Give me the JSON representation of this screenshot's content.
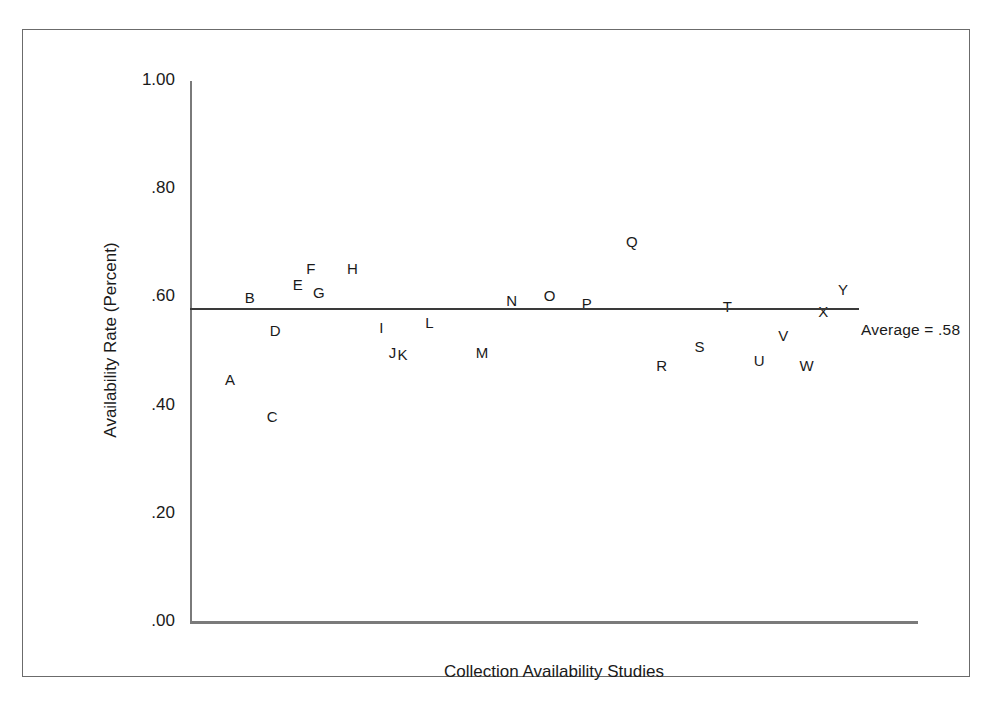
{
  "figure": {
    "background_color": "#ffffff",
    "frame_color": "#6b6b6b",
    "axis_color": "#7a7a7a",
    "text_color": "#1a1a1a",
    "average_line_color": "#3a3a3a"
  },
  "chart_data": {
    "type": "scatter",
    "title": "",
    "xlabel": "Collection Availability Studies",
    "ylabel": "Availability Rate (Percent)",
    "ylim": [
      0.0,
      1.0
    ],
    "ytick_labels": [
      "1.00",
      ".80",
      ".60",
      ".40",
      ".20",
      ".00"
    ],
    "ytick_values": [
      1.0,
      0.8,
      0.6,
      0.4,
      0.2,
      0.0
    ],
    "grid": false,
    "legend": false,
    "annotations": [
      {
        "text": "Average = .58",
        "value": 0.58
      }
    ],
    "reference_line": {
      "label": "Average = .58",
      "value": 0.58
    },
    "point_labels": [
      "A",
      "B",
      "C",
      "D",
      "E",
      "F",
      "G",
      "H",
      "I",
      "J",
      "K",
      "L",
      "M",
      "N",
      "O",
      "P",
      "Q",
      "R",
      "S",
      "T",
      "U",
      "V",
      "W",
      "X",
      "Y"
    ],
    "values": [
      0.45,
      0.6,
      0.38,
      0.54,
      0.625,
      0.655,
      0.61,
      0.655,
      0.545,
      0.5,
      0.495,
      0.555,
      0.5,
      0.595,
      0.605,
      0.59,
      0.705,
      0.475,
      0.51,
      0.585,
      0.485,
      0.53,
      0.475,
      0.575,
      0.615
    ],
    "points": [
      {
        "label": "A",
        "x": 0.055,
        "value": 0.45
      },
      {
        "label": "B",
        "x": 0.082,
        "value": 0.6
      },
      {
        "label": "C",
        "x": 0.113,
        "value": 0.38
      },
      {
        "label": "D",
        "x": 0.117,
        "value": 0.54
      },
      {
        "label": "E",
        "x": 0.148,
        "value": 0.625
      },
      {
        "label": "F",
        "x": 0.166,
        "value": 0.655
      },
      {
        "label": "G",
        "x": 0.177,
        "value": 0.61
      },
      {
        "label": "H",
        "x": 0.223,
        "value": 0.655
      },
      {
        "label": "I",
        "x": 0.263,
        "value": 0.545
      },
      {
        "label": "J",
        "x": 0.278,
        "value": 0.5
      },
      {
        "label": "K",
        "x": 0.292,
        "value": 0.495
      },
      {
        "label": "L",
        "x": 0.329,
        "value": 0.555
      },
      {
        "label": "M",
        "x": 0.401,
        "value": 0.5
      },
      {
        "label": "N",
        "x": 0.442,
        "value": 0.595
      },
      {
        "label": "O",
        "x": 0.494,
        "value": 0.605
      },
      {
        "label": "P",
        "x": 0.545,
        "value": 0.59
      },
      {
        "label": "Q",
        "x": 0.607,
        "value": 0.705
      },
      {
        "label": "R",
        "x": 0.648,
        "value": 0.475
      },
      {
        "label": "S",
        "x": 0.7,
        "value": 0.51
      },
      {
        "label": "T",
        "x": 0.738,
        "value": 0.585
      },
      {
        "label": "U",
        "x": 0.782,
        "value": 0.485
      },
      {
        "label": "V",
        "x": 0.815,
        "value": 0.53
      },
      {
        "label": "W",
        "x": 0.847,
        "value": 0.475
      },
      {
        "label": "X",
        "x": 0.87,
        "value": 0.575
      },
      {
        "label": "Y",
        "x": 0.897,
        "value": 0.615
      }
    ]
  }
}
